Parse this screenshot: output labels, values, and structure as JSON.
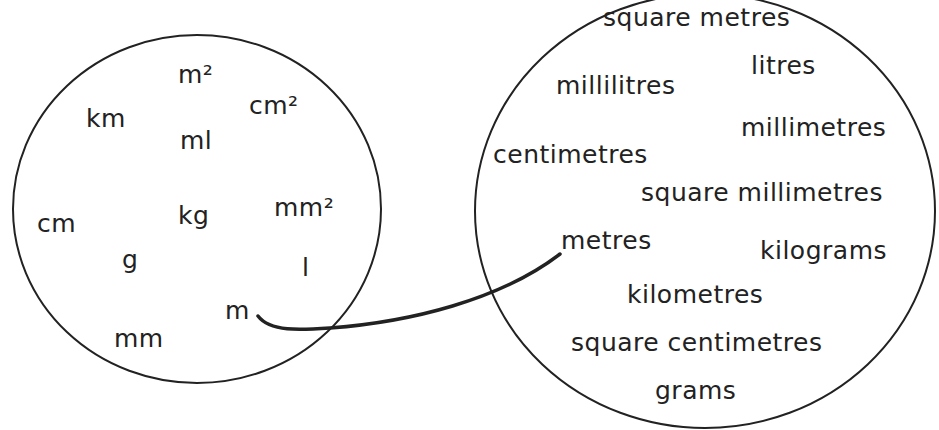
{
  "abbreviations": [
    {
      "text": "m²",
      "x": 178,
      "y": 62
    },
    {
      "text": "km",
      "x": 86,
      "y": 106
    },
    {
      "text": "cm²",
      "x": 249,
      "y": 93
    },
    {
      "text": "ml",
      "x": 180,
      "y": 128
    },
    {
      "text": "cm",
      "x": 37,
      "y": 211
    },
    {
      "text": "kg",
      "x": 178,
      "y": 203
    },
    {
      "text": "mm²",
      "x": 274,
      "y": 195
    },
    {
      "text": "g",
      "x": 122,
      "y": 247
    },
    {
      "text": "l",
      "x": 302,
      "y": 255
    },
    {
      "text": "m",
      "x": 225,
      "y": 298
    },
    {
      "text": "mm",
      "x": 114,
      "y": 326
    }
  ],
  "names": [
    {
      "text": "square metres",
      "x": 603,
      "y": 5
    },
    {
      "text": "litres",
      "x": 751,
      "y": 53
    },
    {
      "text": "millilitres",
      "x": 556,
      "y": 73
    },
    {
      "text": "millimetres",
      "x": 741,
      "y": 115
    },
    {
      "text": "centimetres",
      "x": 493,
      "y": 142
    },
    {
      "text": "square millimetres",
      "x": 641,
      "y": 180
    },
    {
      "text": "metres",
      "x": 561,
      "y": 228
    },
    {
      "text": "kilograms",
      "x": 760,
      "y": 238
    },
    {
      "text": "kilometres",
      "x": 627,
      "y": 282
    },
    {
      "text": "square centimetres",
      "x": 571,
      "y": 330
    },
    {
      "text": "grams",
      "x": 655,
      "y": 378
    }
  ],
  "connection": {
    "from": "m",
    "to": "metres"
  },
  "colors": {
    "stroke": "#222222",
    "text": "#222222"
  }
}
